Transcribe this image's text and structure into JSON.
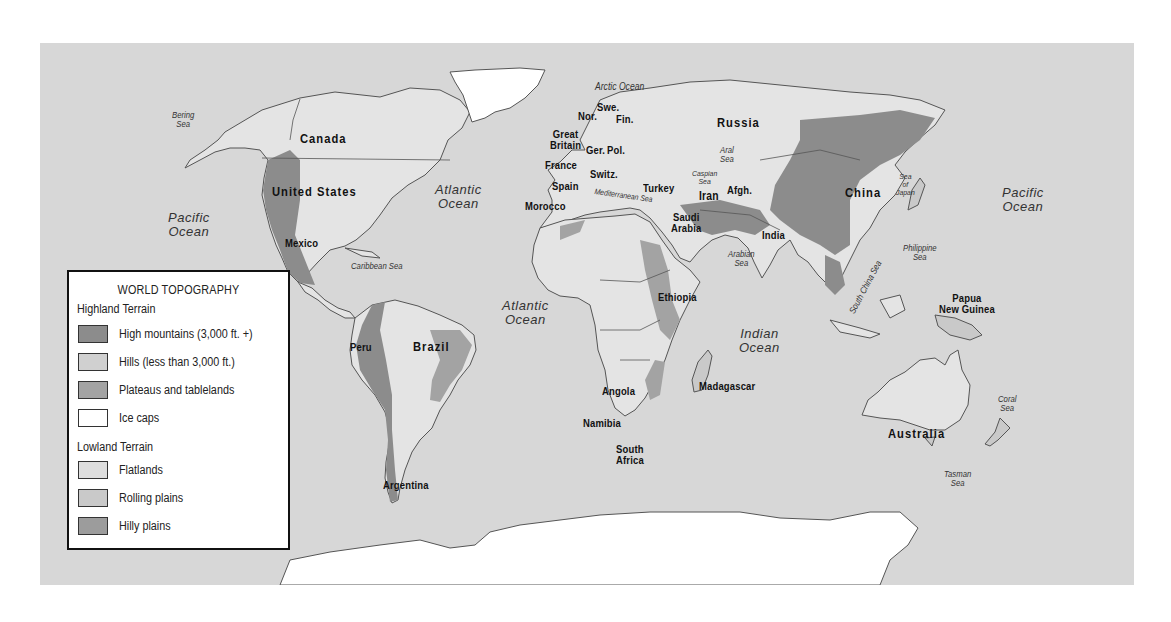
{
  "map": {
    "title": "WORLD TOPOGRAPHY",
    "colors": {
      "ocean": "#d7d7d7",
      "land": "#e6e6e6",
      "border": "#555555",
      "high_mountains": "#8c8c8c",
      "hills": "#d0d0d0",
      "plateaus": "#a3a3a3",
      "ice_caps": "#ffffff",
      "flatlands": "#dedede",
      "rolling_plains": "#c9c9c9",
      "hilly_plains": "#9c9c9c"
    },
    "legend": {
      "title": "WORLD TOPOGRAPHY",
      "highland_heading": "Highland Terrain",
      "highland_items": [
        {
          "label": "High mountains (3,000 ft. +)",
          "color": "#8c8c8c"
        },
        {
          "label": "Hills (less than 3,000 ft.)",
          "color": "#d0d0d0"
        },
        {
          "label": "Plateaus and tablelands",
          "color": "#a3a3a3"
        },
        {
          "label": "Ice caps",
          "color": "#ffffff"
        }
      ],
      "lowland_heading": "Lowland Terrain",
      "lowland_items": [
        {
          "label": "Flatlands",
          "color": "#dedede"
        },
        {
          "label": "Rolling plains",
          "color": "#c9c9c9"
        },
        {
          "label": "Hilly plains",
          "color": "#9c9c9c"
        }
      ]
    },
    "oceans": {
      "pacific_west": "Pacific\nOcean",
      "pacific_east": "Pacific\nOcean",
      "atlantic_north": "Atlantic\nOcean",
      "atlantic_south": "Atlantic\nOcean",
      "indian": "Indian\nOcean",
      "arctic": "Arctic Ocean"
    },
    "seas": {
      "bering": "Bering\nSea",
      "caribbean": "Caribbean Sea",
      "mediterranean": "Mediterranean Sea",
      "caspian": "Caspian\nSea",
      "aral": "Aral\nSea",
      "arabian": "Arabian\nSea",
      "japan": "Sea\nof\nJapan",
      "philippine": "Philippine\nSea",
      "south_china": "South China Sea",
      "coral": "Coral\nSea",
      "tasman": "Tasman\nSea"
    },
    "countries": {
      "canada": "Canada",
      "united_states": "United States",
      "mexico": "Mexico",
      "peru": "Peru",
      "brazil": "Brazil",
      "argentina": "Argentina",
      "norway": "Nor.",
      "sweden": "Swe.",
      "finland": "Fin.",
      "great_britain": "Great\nBritain",
      "germany": "Ger.",
      "poland": "Pol.",
      "france": "France",
      "switzerland": "Switz.",
      "spain": "Spain",
      "morocco": "Morocco",
      "turkey": "Turkey",
      "russia": "Russia",
      "iran": "Iran",
      "afghanistan": "Afgh.",
      "saudi_arabia": "Saudi\nArabia",
      "ethiopia": "Ethiopia",
      "india": "India",
      "china": "China",
      "angola": "Angola",
      "namibia": "Namibia",
      "south_africa": "South\nAfrica",
      "madagascar": "Madagascar",
      "papua_new_guinea": "Papua\nNew Guinea",
      "australia": "Australia"
    }
  }
}
